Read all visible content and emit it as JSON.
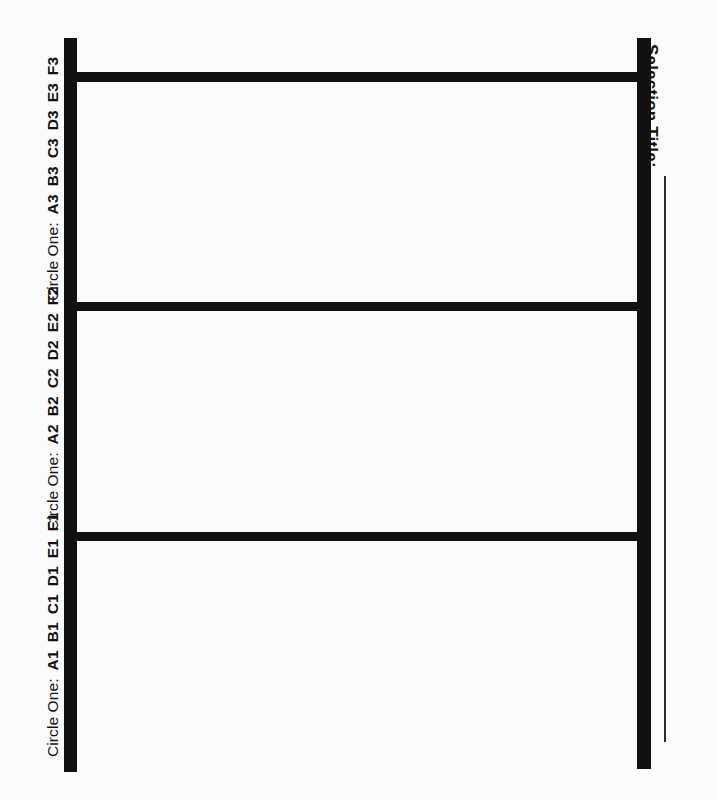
{
  "document": {
    "type": "selection-rack-form",
    "background_color": "#fbfbfb",
    "ink_color": "#111111"
  },
  "frame": {
    "rails": [
      {
        "name": "left-rail",
        "thickness_px": 13
      },
      {
        "name": "right-rail",
        "thickness_px": 14
      }
    ],
    "crossbars": [
      {
        "name": "top-crossbar",
        "thickness_px": 10
      },
      {
        "name": "middle-crossbar",
        "thickness_px": 9
      },
      {
        "name": "bottom-crossbar",
        "thickness_px": 9
      }
    ],
    "slot_count": 3
  },
  "rows": [
    {
      "id": "row-3",
      "prefix": "Circle One:",
      "codes": [
        "A3",
        "B3",
        "C3",
        "D3",
        "E3",
        "F3"
      ],
      "full_label": "Circle One: A3 B3 C3 D3 E3 F3",
      "slot_name": "slot-3"
    },
    {
      "id": "row-2",
      "prefix": "Circle One:",
      "codes": [
        "A2",
        "B2",
        "C2",
        "D2",
        "E2",
        "F2"
      ],
      "full_label": "Circle One: A2 B2 C2 D2 E2 F2",
      "slot_name": "slot-2"
    },
    {
      "id": "row-1",
      "prefix": "Circle One:",
      "codes": [
        "A1",
        "B1",
        "C1",
        "D1",
        "E1",
        "F1"
      ],
      "full_label": "Circle One: A1 B1 C1 D1 E1 F1",
      "slot_name": "slot-1"
    }
  ],
  "selection_title": {
    "label": "Selection Title:",
    "write_in_value": ""
  }
}
